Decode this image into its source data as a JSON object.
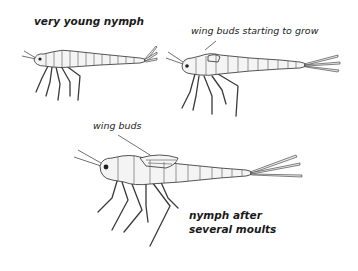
{
  "diagram": {
    "stages": [
      {
        "id": "stage-1",
        "label": "very young nymph"
      },
      {
        "id": "stage-2",
        "callout": "wing buds starting to grow"
      },
      {
        "id": "stage-3",
        "callout": "wing buds",
        "label_line1": "nymph after",
        "label_line2": "several moults"
      }
    ],
    "colors": {
      "background": "#ffffff",
      "ink": "#1a1a1a",
      "body_fill": "#f4f4f4"
    }
  }
}
